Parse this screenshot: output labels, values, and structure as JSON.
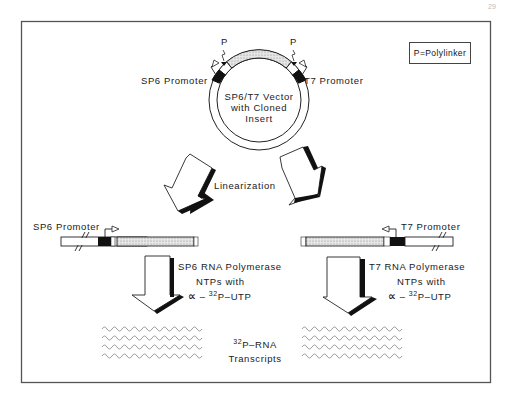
{
  "figure": {
    "page_number": "29",
    "legend": "P=Polylinker",
    "vector": {
      "label_lines": [
        "SP6/T7 Vector",
        "with Cloned",
        "Insert"
      ],
      "left_promoter": "SP6 Promoter",
      "right_promoter": "T7 Promoter",
      "polylinker_marker_left": "P",
      "polylinker_marker_right": "P"
    },
    "step_linearization": "Linearization",
    "left_branch": {
      "promoter_label": "SP6 Promoter",
      "enzyme": "SP6 RNA Polymerase",
      "ntps": "NTPs with",
      "alpha": "∝",
      "label_dash": " – ",
      "isotope": "32",
      "nucleotide": "P–UTP"
    },
    "right_branch": {
      "promoter_label": "T7 Promoter",
      "enzyme": "T7 RNA Polymerase",
      "ntps": "NTPs with",
      "alpha": "∝",
      "label_dash": " – ",
      "isotope": "32",
      "nucleotide": "P–UTP"
    },
    "product": {
      "isotope": "32",
      "line1": "P–RNA",
      "line2": "Transcripts"
    },
    "colors": {
      "frame": "#555555",
      "ink": "#111111",
      "insert_fill": "#d9d9d9",
      "transcript": "#9a9a9a"
    }
  }
}
